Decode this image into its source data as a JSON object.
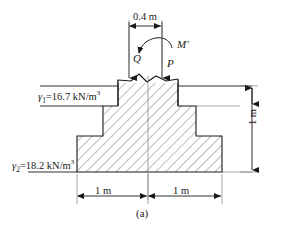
{
  "figure": {
    "caption": "(a)",
    "type": "engineering-diagram"
  },
  "soil_layers": [
    {
      "id": "layer-1",
      "symbol": "γ",
      "subscript": "1",
      "equals": "=",
      "value": "16.7",
      "unit": "kN/m",
      "unit_exponent": "3",
      "full_label": "γ₁=16.7 kN/m³"
    },
    {
      "id": "layer-2",
      "symbol": "γ",
      "subscript": "2",
      "equals": "=",
      "value": "18.2",
      "unit": "kN/m",
      "unit_exponent": "3",
      "full_label": "γ₂=18.2 kN/m³"
    }
  ],
  "loads": [
    {
      "id": "load-Q",
      "label": "Q",
      "kind": "vertical-force-arrow",
      "direction": "down"
    },
    {
      "id": "load-P",
      "label": "P",
      "kind": "vertical-force-arrow",
      "direction": "down"
    },
    {
      "id": "load-M",
      "label": "M′",
      "kind": "moment-arrow",
      "direction": "counterclockwise"
    }
  ],
  "dimensions": [
    {
      "id": "dim-top",
      "label": "0.4 m",
      "orientation": "horizontal"
    },
    {
      "id": "dim-left",
      "label": "1 m",
      "orientation": "horizontal"
    },
    {
      "id": "dim-right",
      "label": "1 m",
      "orientation": "horizontal"
    },
    {
      "id": "dim-height",
      "label": "1 m",
      "orientation": "vertical"
    }
  ],
  "colors": {
    "line": "#1a1a1a",
    "hatch": "#555555",
    "background": "#ffffff",
    "thin_line": "#808080"
  }
}
